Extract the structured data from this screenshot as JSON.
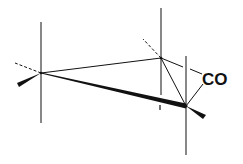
{
  "diagram": {
    "title": "",
    "type": "molecular-structure-sketch",
    "labels": {
      "co": "CO"
    },
    "nodes": [
      {
        "id": "atom-left",
        "kind": "metal-center"
      },
      {
        "id": "atom-middle",
        "kind": "metal-center"
      },
      {
        "id": "atom-right",
        "kind": "metal-center"
      }
    ],
    "bonds": [
      {
        "from": "atom-left",
        "to": "atom-middle",
        "style": "single"
      },
      {
        "from": "atom-left",
        "to": "atom-right",
        "style": "wedge"
      },
      {
        "from": "atom-middle",
        "to": "atom-right",
        "style": "single"
      },
      {
        "from": "atom-middle",
        "to": "CO",
        "style": "bridging-dashed"
      },
      {
        "from": "atom-right",
        "to": "CO",
        "style": "single"
      }
    ],
    "colors": {
      "stroke": "#111111",
      "background": "#ffffff"
    }
  }
}
